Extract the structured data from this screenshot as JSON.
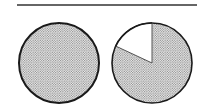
{
  "figure": {
    "top_rule": {
      "x1": 17,
      "x2": 197,
      "y": 5
    },
    "pies": [
      {
        "name": "full-circle",
        "cx": 59,
        "cy": 63,
        "r": 40,
        "fill": "dotted-gray",
        "cutout_wedge": null
      },
      {
        "name": "circle-with-wedge",
        "cx": 152,
        "cy": 63,
        "r": 40,
        "fill": "dotted-gray",
        "cutout_wedge": {
          "start_deg_from_top_ccw": 0,
          "end_deg_from_top_ccw": 65,
          "fill": "#ffffff"
        }
      }
    ],
    "colors": {
      "stroke": "#1a1a1a",
      "dot": "#6e6e6e",
      "background": "#ffffff"
    }
  }
}
